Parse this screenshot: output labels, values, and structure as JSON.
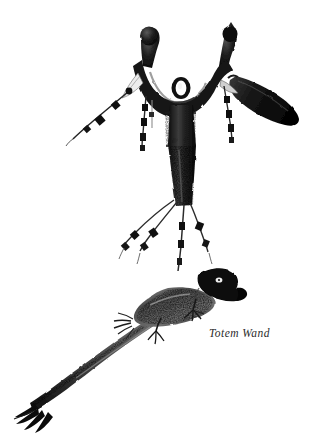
{
  "page": {
    "background_color": "#ffffff",
    "width": 325,
    "height": 445,
    "medium": "stipple pen-and-ink illustration"
  },
  "illustration": {
    "title": "Totem Wand",
    "ink_color": "#141414",
    "mid_tone_color": "#6a6a6a",
    "light_tone_color": "#b9b9b9",
    "highlight_color": "#ffffff",
    "objects": [
      {
        "name": "forked-wand",
        "description": "Y-shaped antler-like wand with two upward prongs, a central white oval eye, a wrapped shaft, and hanging beaded cords and feathers",
        "parts": [
          {
            "name": "left-prong",
            "tip": "rounded knob"
          },
          {
            "name": "right-prong",
            "tip": "pointed angular knob"
          },
          {
            "name": "crosspiece",
            "detail": "curved dark bridge between prongs"
          },
          {
            "name": "eye-oval",
            "detail": "white oval inset in crosspiece"
          },
          {
            "name": "wrapped-band",
            "detail": "light hide wrapping on upper shaft"
          },
          {
            "name": "shaft",
            "detail": "dark stippled tapering handle"
          },
          {
            "name": "right-feather",
            "detail": "large dark feather angling down-right"
          },
          {
            "name": "left-bead-string",
            "detail": "thin cord with dark bead segments angling down-left"
          },
          {
            "name": "center-bead-string",
            "detail": "beaded cord hanging from crosspiece center-left"
          },
          {
            "name": "right-bead-string",
            "detail": "beaded cord hanging from right prong base"
          },
          {
            "name": "bottom-fringe",
            "detail": "four beaded cords hanging from shaft base"
          }
        ]
      },
      {
        "name": "bird-effigy",
        "description": "Long-tailed bird carving with solid black hooked head facing right, stippled body, clawed feet, and splayed black tail feathers",
        "parts": [
          {
            "name": "bird-head",
            "detail": "solid black head with hooked beak pointing right"
          },
          {
            "name": "bird-eye",
            "detail": "small white highlight on head"
          },
          {
            "name": "bird-body",
            "detail": "stippled tapering body angled down-left"
          },
          {
            "name": "front-claw",
            "detail": "small clawed foot under breast"
          },
          {
            "name": "rear-claw",
            "detail": "clawed foot midway along body"
          },
          {
            "name": "wing-tuft",
            "detail": "small feather tuft on upper body"
          },
          {
            "name": "tail",
            "detail": "long curving tail ending in splayed feather tips"
          }
        ]
      }
    ]
  },
  "caption": {
    "text": "Totem Wand",
    "style": "italic serif",
    "color": "#2b2b2b"
  }
}
